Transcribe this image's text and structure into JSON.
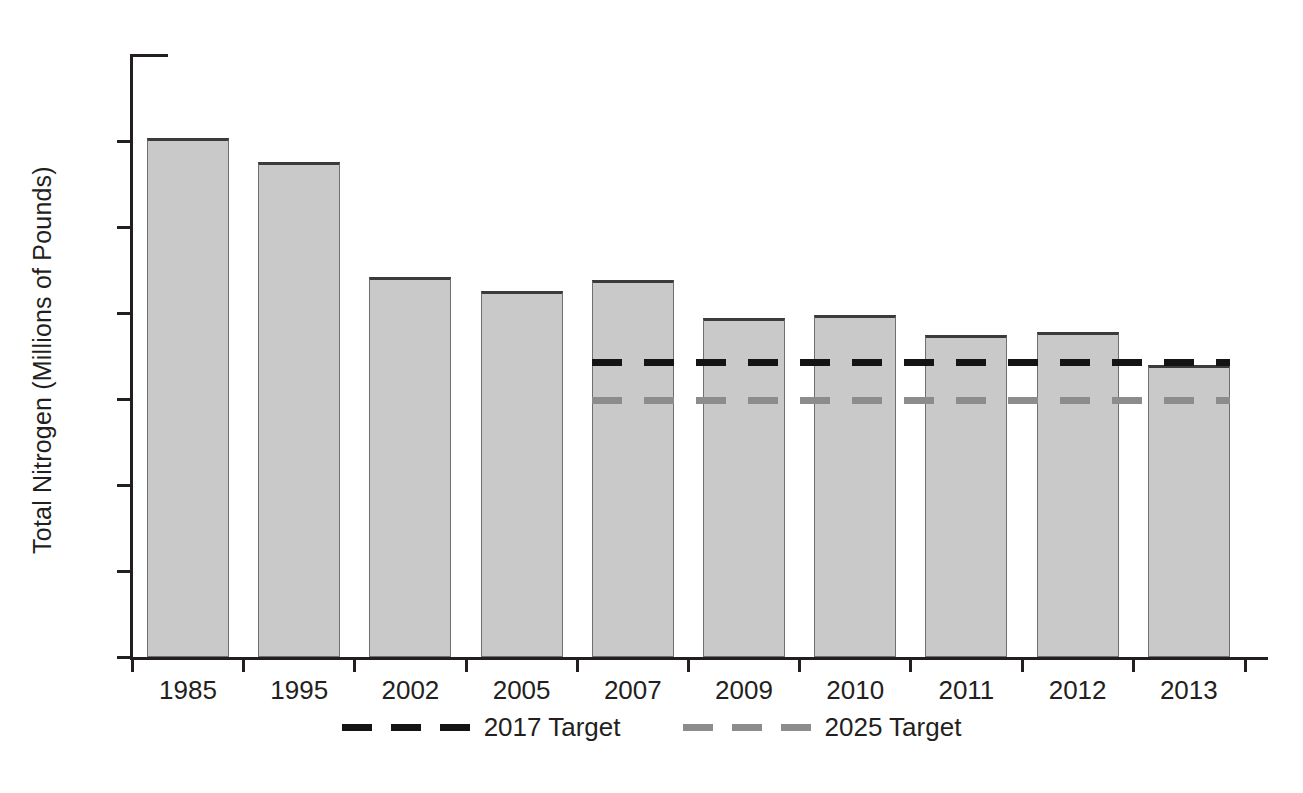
{
  "chart_data": {
    "type": "bar",
    "title": "",
    "xlabel": "",
    "ylabel": "Total Nitrogen (Millions of Pounds)",
    "categories": [
      "1985",
      "1995",
      "2002",
      "2005",
      "2007",
      "2009",
      "2010",
      "2011",
      "2012",
      "2013"
    ],
    "values": [
      30.2,
      28.8,
      22.1,
      21.3,
      21.9,
      19.7,
      19.9,
      18.7,
      18.9,
      17.0
    ],
    "series": [
      {
        "name": "Total Nitrogen",
        "values": [
          30.2,
          28.8,
          22.1,
          21.3,
          21.9,
          19.7,
          19.9,
          18.7,
          18.9,
          17.0
        ]
      }
    ],
    "ylim": [
      0,
      35
    ],
    "yticks": [
      0,
      5,
      10,
      15,
      20,
      25,
      30,
      35
    ],
    "ytick_labels": [
      "0",
      "5",
      "10",
      "15",
      "20",
      "25",
      "30",
      "35"
    ],
    "grid": false,
    "legend_position": "bottom",
    "reference_lines": [
      {
        "label": "2017 Target",
        "value": 17.1,
        "color": "#141414",
        "style": "dashed",
        "starts_at_category": "2007"
      },
      {
        "label": "2025 Target",
        "value": 14.9,
        "color": "#8c8c8c",
        "style": "dashed",
        "starts_at_category": "2007"
      }
    ],
    "bar_fill_color": "#c9c9c9",
    "bar_edge_color": "#3b3b3b",
    "axis_color": "#231f20",
    "background_color": "#ffffff"
  },
  "legend": {
    "items": [
      {
        "label": "2017 Target",
        "color": "#141414"
      },
      {
        "label": "2025 Target",
        "color": "#8c8c8c"
      }
    ]
  }
}
